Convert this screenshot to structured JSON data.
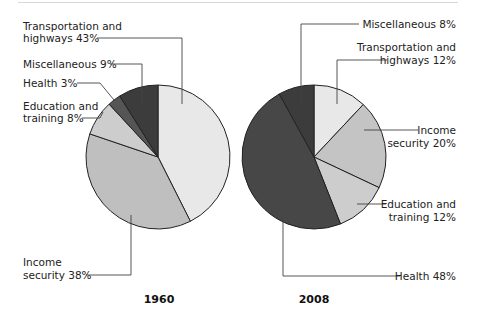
{
  "chart_data": [
    {
      "type": "pie",
      "title": "1960",
      "start_angle": "12 o'clock, clockwise",
      "categories": [
        "Transportation and highways",
        "Income security",
        "Education and training",
        "Health",
        "Miscellaneous"
      ],
      "values": [
        43,
        38,
        8,
        3,
        9
      ],
      "colors": [
        "#e8e8e8",
        "#bfbfbf",
        "#cdcdcd",
        "#555555",
        "#3c3c3c"
      ],
      "labels": {
        "transportation": [
          "Transportation and",
          "highways 43%"
        ],
        "miscellaneous": [
          "Miscellaneous 9%"
        ],
        "health": [
          "Health 3%"
        ],
        "education": [
          "Education and",
          "training 8%"
        ],
        "income": [
          "Income",
          "security 38%"
        ]
      }
    },
    {
      "type": "pie",
      "title": "2008",
      "start_angle": "12 o'clock, clockwise",
      "categories": [
        "Transportation and highways",
        "Income security",
        "Education and training",
        "Health",
        "Miscellaneous"
      ],
      "values": [
        12,
        20,
        12,
        48,
        8
      ],
      "colors": [
        "#e8e8e8",
        "#c4c4c4",
        "#cdcdcd",
        "#474747",
        "#3c3c3c"
      ],
      "labels": {
        "miscellaneous": [
          "Miscellaneous 8%"
        ],
        "transportation": [
          "Transportation and",
          "highways 12%"
        ],
        "income": [
          "Income",
          "security 20%"
        ],
        "education": [
          "Education and",
          "training 12%"
        ],
        "health": [
          "Health 48%"
        ]
      }
    }
  ],
  "years": {
    "left": "1960",
    "right": "2008"
  }
}
